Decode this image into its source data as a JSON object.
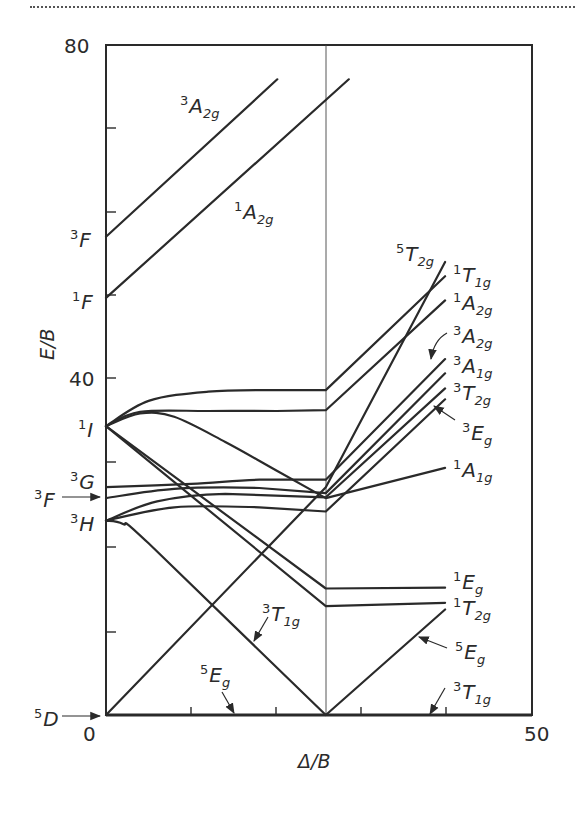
{
  "chart_data": {
    "type": "line",
    "title": "",
    "xlabel": "Δ/B",
    "ylabel": "E/B",
    "xlim": [
      0,
      50
    ],
    "ylim": [
      0,
      80
    ],
    "x_ticks": [
      "0",
      "50"
    ],
    "y_ticks": [
      "80",
      "40"
    ],
    "minor_tick_step_x": 10,
    "minor_tick_step_y": 10,
    "grid": false,
    "critical_line_x": 25.8,
    "free_ion_terms": [
      {
        "term": "3F",
        "spin": "3",
        "letter": "F",
        "y": 57.1
      },
      {
        "term": "1F",
        "spin": "1",
        "letter": "F",
        "y": 49.8
      },
      {
        "term": "1I",
        "spin": "1",
        "letter": "I",
        "y": 34.5
      },
      {
        "term": "3G",
        "spin": "3",
        "letter": "G",
        "y": 27.2
      },
      {
        "term": "3F",
        "spin": "3",
        "letter": "F",
        "y": 25.9,
        "arrow": true
      },
      {
        "term": "3H",
        "spin": "3",
        "letter": "H",
        "y": 23.2
      },
      {
        "term": "5D",
        "spin": "5",
        "letter": "D",
        "y": 0,
        "arrow": true
      }
    ],
    "series": [
      {
        "name": "3A2g (upper)",
        "points": [
          [
            0,
            57.1
          ],
          [
            20.1,
            75.9
          ]
        ]
      },
      {
        "name": "1A2g (upper)",
        "points": [
          [
            0,
            49.8
          ],
          [
            28.5,
            75.9
          ]
        ]
      },
      {
        "name": "5T2g",
        "points": [
          [
            0,
            0
          ],
          [
            25.8,
            27.2
          ],
          [
            39.8,
            54.1
          ]
        ]
      },
      {
        "name": "1T1g",
        "points": [
          [
            0,
            34.5
          ],
          [
            5,
            37.5
          ],
          [
            12,
            38.6
          ],
          [
            20,
            38.8
          ],
          [
            25.8,
            38.8
          ],
          [
            39.8,
            52.4
          ]
        ]
      },
      {
        "name": "1A2g",
        "points": [
          [
            0,
            34.5
          ],
          [
            4,
            36.2
          ],
          [
            12,
            36.3
          ],
          [
            20,
            36.3
          ],
          [
            25.8,
            36.4
          ],
          [
            39.8,
            49.5
          ]
        ]
      },
      {
        "name": "1I descending (to 1A1g)",
        "points": [
          [
            0,
            34.5
          ],
          [
            4,
            36.0
          ],
          [
            8,
            35.6
          ],
          [
            14,
            32.6
          ],
          [
            20,
            29.2
          ],
          [
            25.8,
            25.9
          ],
          [
            39.8,
            29.5
          ]
        ]
      },
      {
        "name": "3A2g",
        "points": [
          [
            0,
            27.2
          ],
          [
            10,
            27.6
          ],
          [
            18,
            28.1
          ],
          [
            25.8,
            28.1
          ],
          [
            39.8,
            42.5
          ]
        ]
      },
      {
        "name": "3A1g",
        "points": [
          [
            0,
            25.9
          ],
          [
            8,
            27.0
          ],
          [
            18,
            27.1
          ],
          [
            25.8,
            26.5
          ],
          [
            39.8,
            40.8
          ]
        ]
      },
      {
        "name": "3T2g",
        "points": [
          [
            0,
            23.2
          ],
          [
            6,
            25.5
          ],
          [
            14,
            26.4
          ],
          [
            25.8,
            26.0
          ],
          [
            39.8,
            39.0
          ]
        ]
      },
      {
        "name": "3Eg",
        "points": [
          [
            0,
            23.2
          ],
          [
            8,
            24.8
          ],
          [
            18,
            24.8
          ],
          [
            25.8,
            24.3
          ],
          [
            39.8,
            37.7
          ]
        ]
      },
      {
        "name": "1Eg",
        "points": [
          [
            0,
            34.5
          ],
          [
            25.8,
            15.1
          ],
          [
            39.8,
            15.2
          ]
        ]
      },
      {
        "name": "1T2g",
        "points": [
          [
            0,
            34.5
          ],
          [
            25.8,
            13.0
          ],
          [
            39.8,
            13.4
          ]
        ]
      },
      {
        "name": "3T1g (from 3H)",
        "points": [
          [
            0,
            23.2
          ],
          [
            2,
            22.8
          ],
          [
            5,
            20.5
          ],
          [
            25.8,
            0
          ]
        ]
      },
      {
        "name": "5Eg",
        "points": [
          [
            0,
            0
          ],
          [
            25.8,
            0
          ],
          [
            39.8,
            12.6
          ]
        ]
      },
      {
        "name": "3T1g (strong field)",
        "points": [
          [
            25.8,
            0
          ],
          [
            50,
            0
          ]
        ]
      }
    ],
    "annotations": [
      {
        "text": "3A2g",
        "spin": "3",
        "sym": "A",
        "sub": "2g",
        "side": "upper-left"
      },
      {
        "text": "1A2g",
        "spin": "1",
        "sym": "A",
        "sub": "2g",
        "side": "upper-middle"
      },
      {
        "text": "5T2g",
        "spin": "5",
        "sym": "T",
        "sub": "2g",
        "side": "right"
      },
      {
        "text": "1T1g",
        "spin": "1",
        "sym": "T",
        "sub": "1g",
        "side": "right"
      },
      {
        "text": "1A2g",
        "spin": "1",
        "sym": "A",
        "sub": "2g",
        "side": "right"
      },
      {
        "text": "3A2g",
        "spin": "3",
        "sym": "A",
        "sub": "2g",
        "side": "right",
        "arrow": true
      },
      {
        "text": "3A1g",
        "spin": "3",
        "sym": "A",
        "sub": "1g",
        "side": "right"
      },
      {
        "text": "3T2g",
        "spin": "3",
        "sym": "T",
        "sub": "2g",
        "side": "right"
      },
      {
        "text": "3Eg",
        "spin": "3",
        "sym": "E",
        "sub": "g",
        "side": "right",
        "arrow": true
      },
      {
        "text": "1A1g",
        "spin": "1",
        "sym": "A",
        "sub": "1g",
        "side": "right"
      },
      {
        "text": "1Eg",
        "spin": "1",
        "sym": "E",
        "sub": "g",
        "side": "right"
      },
      {
        "text": "1T2g",
        "spin": "1",
        "sym": "T",
        "sub": "2g",
        "side": "right"
      },
      {
        "text": "5Eg",
        "spin": "5",
        "sym": "E",
        "sub": "g",
        "side": "right",
        "arrow": true
      },
      {
        "text": "3T1g",
        "spin": "3",
        "sym": "T",
        "sub": "1g",
        "side": "right",
        "arrow": true
      },
      {
        "text": "3T1g",
        "spin": "3",
        "sym": "T",
        "sub": "1g",
        "side": "middle",
        "arrow": true
      },
      {
        "text": "5Eg",
        "spin": "5",
        "sym": "E",
        "sub": "g",
        "side": "middle",
        "arrow": true
      }
    ]
  },
  "axis": {
    "y_top": "80",
    "y_mid": "40",
    "x_left": "0",
    "x_right": "50",
    "xlabel": "Δ/B",
    "ylabel": "E/B"
  },
  "terms": {
    "t3F_hi": {
      "spin": "3",
      "letter": "F"
    },
    "t1F": {
      "spin": "1",
      "letter": "F"
    },
    "t1I": {
      "spin": "1",
      "letter": "I"
    },
    "t3G": {
      "spin": "3",
      "letter": "G"
    },
    "t3F_lo": {
      "spin": "3",
      "letter": "F"
    },
    "t3H": {
      "spin": "3",
      "letter": "H"
    },
    "t5D": {
      "spin": "5",
      "letter": "D"
    }
  },
  "labels": {
    "a3A2g_top": {
      "spin": "3",
      "sym": "A",
      "sub": "2g"
    },
    "a1A2g_top": {
      "spin": "1",
      "sym": "A",
      "sub": "2g"
    },
    "r5T2g": {
      "spin": "5",
      "sym": "T",
      "sub": "2g"
    },
    "r1T1g": {
      "spin": "1",
      "sym": "T",
      "sub": "1g"
    },
    "r1A2g": {
      "spin": "1",
      "sym": "A",
      "sub": "2g"
    },
    "r3A2g": {
      "spin": "3",
      "sym": "A",
      "sub": "2g"
    },
    "r3A1g": {
      "spin": "3",
      "sym": "A",
      "sub": "1g"
    },
    "r3T2g": {
      "spin": "3",
      "sym": "T",
      "sub": "2g"
    },
    "r3Eg": {
      "spin": "3",
      "sym": "E",
      "sub": "g"
    },
    "r1A1g": {
      "spin": "1",
      "sym": "A",
      "sub": "1g"
    },
    "r1Eg": {
      "spin": "1",
      "sym": "E",
      "sub": "g"
    },
    "r1T2g": {
      "spin": "1",
      "sym": "T",
      "sub": "2g"
    },
    "r5Eg": {
      "spin": "5",
      "sym": "E",
      "sub": "g"
    },
    "r3T1g": {
      "spin": "3",
      "sym": "T",
      "sub": "1g"
    },
    "m3T1g": {
      "spin": "3",
      "sym": "T",
      "sub": "1g"
    },
    "m5Eg": {
      "spin": "5",
      "sym": "E",
      "sub": "g"
    }
  }
}
